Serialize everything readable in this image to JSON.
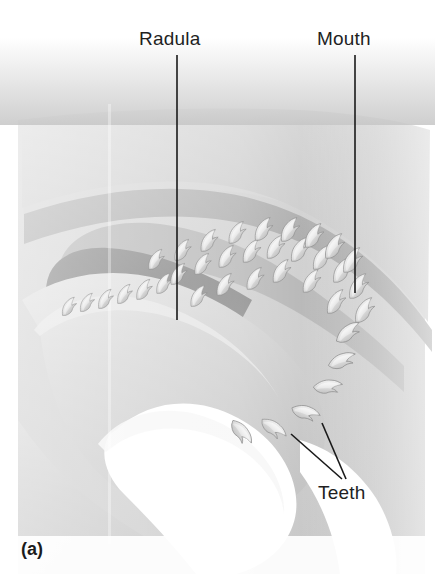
{
  "figure": {
    "panel_caption": "(a)",
    "kind": "anatomical-illustration",
    "palette": {
      "background": "#ffffff",
      "tissue_light": "#c9c9c9",
      "tissue_mid": "#b0b0b0",
      "tissue_dark": "#8d8d8d",
      "cavity_dark": "#6f6f6f",
      "lumen_white": "#ffffff",
      "tooth_pale": "#e8e8e8",
      "tooth_shadow": "#9a9a9a",
      "leader_line": "#1a1a1a",
      "text": "#221f1f"
    }
  },
  "labels": {
    "radula": {
      "text": "Radula",
      "x": 139,
      "y": 29
    },
    "mouth": {
      "text": "Mouth",
      "x": 317,
      "y": 29
    },
    "teeth": {
      "text": "Teeth",
      "x": 318,
      "y": 483
    }
  },
  "leader_lines": [
    {
      "name": "radula-leader",
      "x1": 177,
      "y1": 55,
      "x2": 177,
      "y2": 320
    },
    {
      "name": "mouth-leader",
      "x1": 355,
      "y1": 55,
      "x2": 355,
      "y2": 293
    },
    {
      "name": "teeth-leader-left",
      "x1": 342,
      "y1": 479,
      "x2": 291,
      "y2": 434
    },
    {
      "name": "teeth-leader-right",
      "x1": 346,
      "y1": 479,
      "x2": 322,
      "y2": 423
    }
  ],
  "structures": [
    {
      "name": "upper-tissue-mass",
      "tone": "#c4c4c4"
    },
    {
      "name": "odontophore-bolster",
      "tone": "#c9c9c9"
    },
    {
      "name": "buccal-cavity-band",
      "tone": "#9a9a9a"
    },
    {
      "name": "radular-sac-pocket",
      "tone": "#6f6f6f"
    },
    {
      "name": "lumen-cavity",
      "tone": "#ffffff"
    },
    {
      "name": "radular-teeth-rows",
      "tone": "#e8e8e8",
      "count": 34
    }
  ]
}
